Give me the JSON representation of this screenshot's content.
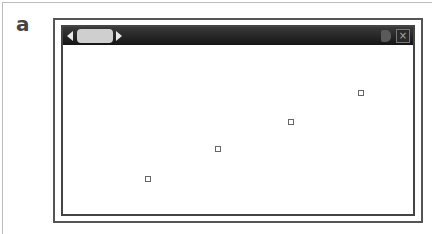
{
  "panel": {
    "label": "a"
  },
  "window": {
    "titlebar": {
      "nav_left_icon": "triangle-left",
      "nav_right_icon": "triangle-right",
      "speaker_icon": "speaker",
      "close_label": "×"
    }
  },
  "plot": {
    "points": [
      {
        "x": 85,
        "y": 134
      },
      {
        "x": 155,
        "y": 104
      },
      {
        "x": 228,
        "y": 77
      },
      {
        "x": 298,
        "y": 48
      }
    ]
  }
}
